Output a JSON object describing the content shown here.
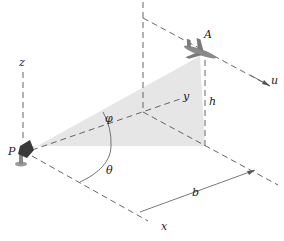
{
  "diagram": {
    "labels": {
      "z": "z",
      "y": "y",
      "x": "x",
      "u": "u",
      "P": "P",
      "A": "A",
      "h": "h",
      "b": "b",
      "phi": "φ",
      "theta": "θ"
    },
    "colors": {
      "shade": "#e4e4e4",
      "line": "#555555",
      "aircraft": "#8a8a8a",
      "radar": "#3a3a3a"
    }
  }
}
